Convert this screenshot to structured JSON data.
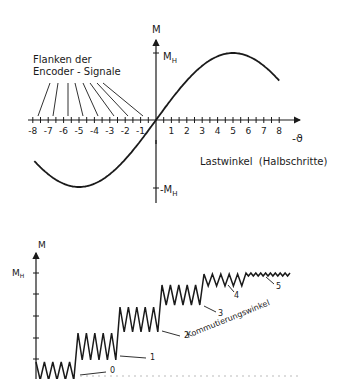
{
  "top_diagram": {
    "y_axis_label": "M",
    "y_max_label": "M_H",
    "y_min_label": "-M_H",
    "x_axis_label": "-ϑ",
    "x_axis_title": "Lastwinkel  (Halbschritte)",
    "x_ticks": [
      "-8",
      "-7",
      "-6",
      "-5",
      "-4",
      "-3",
      "-2",
      "-1",
      "1",
      "2",
      "3",
      "4",
      "5",
      "6",
      "7",
      "8"
    ],
    "annotation_line1": "Flanken der",
    "annotation_line2": "Encoder - Signale",
    "curve": "sinusoidal torque curve, peak M_H at x=5, minimum -M_H at x=-5",
    "curve_peak_x": 5,
    "curve_min_x": -5
  },
  "bottom_diagram": {
    "y_axis_label": "M",
    "y_max_label": "M_H",
    "step_labels": [
      "0",
      "1",
      "2",
      "3",
      "4",
      "5"
    ],
    "diagonal_label": "Kommutierungswinkel"
  }
}
